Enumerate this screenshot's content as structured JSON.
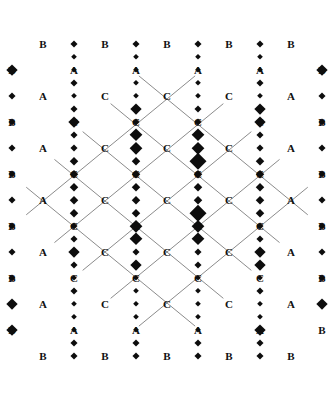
{
  "figure": {
    "title": "",
    "type": "diamond-lattice-diagram",
    "canvas": {
      "width": 334,
      "height": 402
    },
    "colors": {
      "background": "#ffffff",
      "line": "#6d6d6d",
      "node": "#0d0d0d",
      "label": "#111111"
    },
    "geometry": {
      "origin_x": 167,
      "origin_y": 201,
      "half_diagonal_x": 31,
      "half_diagonal_y": 25.5,
      "columns": 5,
      "rows": 9,
      "line_width": 0.8
    },
    "legend": {
      "a_label": "A",
      "b_label": "B",
      "c_label": "C"
    },
    "label_rows": [
      {
        "row": 0,
        "cy": 44,
        "labels": [
          "B",
          "B",
          "B",
          "B",
          "B"
        ]
      },
      {
        "row": 1,
        "cy": 70,
        "labels": [
          "B",
          "A",
          "A",
          "A",
          "A",
          "B"
        ]
      },
      {
        "row": 2,
        "cy": 96,
        "labels": [
          "A",
          "C",
          "C",
          "C",
          "A"
        ]
      },
      {
        "row": 3,
        "cy": 122,
        "labels": [
          "B",
          "C",
          "C",
          "C",
          "C",
          "B"
        ]
      },
      {
        "row": 4,
        "cy": 148,
        "labels": [
          "A",
          "C",
          "C",
          "C",
          "A"
        ]
      },
      {
        "row": 5,
        "cy": 174,
        "labels": [
          "B",
          "C",
          "C",
          "C",
          "C",
          "B"
        ]
      },
      {
        "row": 6,
        "cy": 200,
        "labels": [
          "A",
          "C",
          "C",
          "C",
          "A"
        ]
      },
      {
        "row": 7,
        "cy": 226,
        "labels": [
          "B",
          "C",
          "C",
          "C",
          "C",
          "B"
        ]
      },
      {
        "row": 8,
        "cy": 252,
        "labels": [
          "A",
          "C",
          "C",
          "C",
          "A"
        ]
      },
      {
        "row": 9,
        "cy": 278,
        "labels": [
          "B",
          "C",
          "C",
          "C",
          "C",
          "B"
        ]
      },
      {
        "row": 10,
        "cy": 304,
        "labels": [
          "A",
          "C",
          "C",
          "C",
          "A"
        ]
      },
      {
        "row": 11,
        "cy": 330,
        "labels": [
          "B",
          "A",
          "A",
          "A",
          "A",
          "B"
        ]
      },
      {
        "row": 12,
        "cy": 356,
        "labels": [
          "B",
          "B",
          "B",
          "B",
          "B"
        ]
      }
    ],
    "node_rows": [
      {
        "row": 0,
        "cy": 44,
        "sizes": [
          0,
          7,
          7,
          7,
          7,
          0
        ]
      },
      {
        "row": 1,
        "cy": 57,
        "sizes": [
          0,
          6,
          6,
          6,
          6,
          0
        ]
      },
      {
        "row": 2,
        "cy": 70,
        "sizes": [
          11,
          6,
          6,
          6,
          6,
          11
        ]
      },
      {
        "row": 3,
        "cy": 83,
        "sizes": [
          0,
          7,
          6,
          6,
          7,
          0
        ]
      },
      {
        "row": 4,
        "cy": 96,
        "sizes": [
          7,
          6,
          6,
          6,
          6,
          7
        ]
      },
      {
        "row": 5,
        "cy": 109,
        "sizes": [
          0,
          7,
          11,
          7,
          11,
          0
        ]
      },
      {
        "row": 6,
        "cy": 122,
        "sizes": [
          7,
          11,
          7,
          7,
          11,
          7
        ]
      },
      {
        "row": 7,
        "cy": 135,
        "sizes": [
          0,
          7,
          13,
          13,
          7,
          0
        ]
      },
      {
        "row": 8,
        "cy": 148,
        "sizes": [
          7,
          7,
          12,
          12,
          7,
          7
        ]
      },
      {
        "row": 9,
        "cy": 161,
        "sizes": [
          0,
          8,
          8,
          16,
          8,
          0
        ]
      },
      {
        "row": 10,
        "cy": 174,
        "sizes": [
          7,
          8,
          8,
          8,
          8,
          7
        ]
      },
      {
        "row": 11,
        "cy": 187,
        "sizes": [
          0,
          8,
          8,
          8,
          8,
          0
        ]
      },
      {
        "row": 12,
        "cy": 200,
        "sizes": [
          7,
          8,
          8,
          8,
          8,
          7
        ]
      },
      {
        "row": 13,
        "cy": 213,
        "sizes": [
          0,
          8,
          8,
          16,
          8,
          0
        ]
      },
      {
        "row": 14,
        "cy": 226,
        "sizes": [
          7,
          7,
          12,
          12,
          7,
          7
        ]
      },
      {
        "row": 15,
        "cy": 239,
        "sizes": [
          0,
          7,
          13,
          13,
          7,
          0
        ]
      },
      {
        "row": 16,
        "cy": 252,
        "sizes": [
          7,
          11,
          7,
          7,
          11,
          7
        ]
      },
      {
        "row": 17,
        "cy": 265,
        "sizes": [
          0,
          7,
          11,
          7,
          11,
          0
        ]
      },
      {
        "row": 18,
        "cy": 278,
        "sizes": [
          7,
          6,
          6,
          6,
          6,
          7
        ]
      },
      {
        "row": 19,
        "cy": 291,
        "sizes": [
          0,
          7,
          6,
          6,
          7,
          0
        ]
      },
      {
        "row": 20,
        "cy": 304,
        "sizes": [
          11,
          6,
          6,
          6,
          6,
          11
        ]
      },
      {
        "row": 21,
        "cy": 317,
        "sizes": [
          0,
          6,
          6,
          6,
          6,
          0
        ]
      },
      {
        "row": 22,
        "cy": 330,
        "sizes": [
          11,
          6,
          6,
          6,
          11,
          0
        ]
      },
      {
        "row": 23,
        "cy": 343,
        "sizes": [
          0,
          7,
          7,
          7,
          7,
          0
        ]
      },
      {
        "row": 24,
        "cy": 356,
        "sizes": [
          0,
          7,
          7,
          7,
          7,
          0
        ]
      }
    ]
  }
}
